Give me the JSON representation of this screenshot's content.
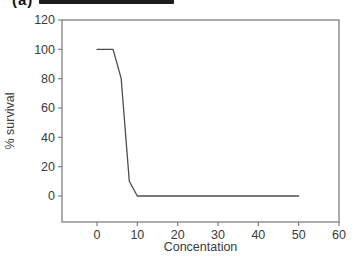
{
  "header": {
    "panel_label": "(a)"
  },
  "colors": {
    "background": "#ffffff",
    "frame": "#808080",
    "tick": "#808080",
    "line": "#4d4d4d",
    "text": "#3a3a3a",
    "redaction": "#1c1c1c"
  },
  "chart_data": {
    "type": "line",
    "title": "",
    "xlabel": "Concentation",
    "ylabel": "% survival",
    "x": [
      0,
      4,
      6,
      8,
      10,
      50
    ],
    "y": [
      100,
      100,
      80,
      10,
      0,
      0
    ],
    "series": [
      {
        "name": "% survival",
        "points": [
          [
            0,
            100
          ],
          [
            4,
            100
          ],
          [
            6,
            80
          ],
          [
            8,
            10
          ],
          [
            10,
            0
          ],
          [
            50,
            0
          ]
        ]
      }
    ],
    "x_ticks": [
      0,
      10,
      20,
      30,
      40,
      50,
      60
    ],
    "y_ticks": [
      0,
      20,
      40,
      60,
      80,
      100,
      120
    ],
    "xlim": [
      0,
      60
    ],
    "ylim": [
      0,
      120
    ],
    "grid": false,
    "legend": "none",
    "plot_border": true
  }
}
